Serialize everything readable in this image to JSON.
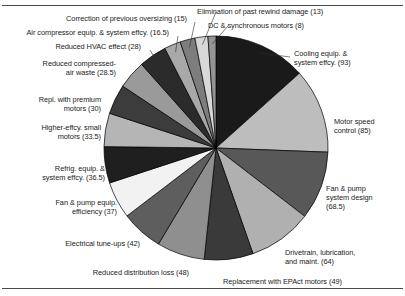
{
  "figure": {
    "kind": "pie-chart-figure",
    "background": "#ffffff",
    "rule_color": "#4a4a4a"
  },
  "chart_data": {
    "type": "pie",
    "title": "",
    "xlabel": "",
    "ylabel": "",
    "legend_position": "callout-labels",
    "grid": false,
    "total": 715.5,
    "units": "billion kWh",
    "start_angle_deg": 0,
    "direction": "clockwise",
    "center": [
      216,
      148
    ],
    "radius": 112,
    "categories": [
      "Cooling equip. & system effcy.",
      "Motor speed control",
      "Fan & pump system design",
      "Drivetrain, lubrication, and maint.",
      "Replacement with EPAct motors",
      "Reduced distribution loss",
      "Electrical tune-ups",
      "Fan & pump equip. efficiency",
      "Refrig. equip. & system effcy.",
      "Higher-effcy. small motors",
      "Repl. with premium motors",
      "Reduced compressed-air waste",
      "Reduced HVAC effect",
      "Air compressor equip. & system effcy.",
      "Correction of previous oversizing",
      "Elimination of past rewind damage",
      "DC & synchronous motors"
    ],
    "values": [
      93,
      85,
      68.5,
      64,
      49,
      48,
      42,
      37,
      36.5,
      33.5,
      30,
      28.5,
      28,
      16.5,
      15,
      13,
      8
    ],
    "colors": [
      "#1a1a1a",
      "#bdbdbd",
      "#585858",
      "#b0b0b0",
      "#3a3a3a",
      "#8f8f8f",
      "#5e5e5e",
      "#f2f2f2",
      "#1f1f1f",
      "#b5b5b5",
      "#3c3c3c",
      "#9a9a9a",
      "#2b2b2b",
      "#a8a8a8",
      "#7d7d7d",
      "#d8d8d8",
      "#949494"
    ],
    "slice_outline": "#000000"
  },
  "labels": [
    {
      "id": "cooling-equip",
      "lines": [
        "Cooling equip. &",
        "system effcy. (93)"
      ]
    },
    {
      "id": "motor-speed-control",
      "lines": [
        "Motor speed",
        "control (85)"
      ]
    },
    {
      "id": "fan-pump-system",
      "lines": [
        "Fan & pump",
        "system design",
        "(68.5)"
      ]
    },
    {
      "id": "drivetrain",
      "lines": [
        "Drivetrain, lubrication,",
        "and maint. (64)"
      ]
    },
    {
      "id": "epact-motors",
      "lines": [
        "Replacement with EPAct motors (49)"
      ]
    },
    {
      "id": "distribution-loss",
      "lines": [
        "Reduced distribution loss (48)"
      ]
    },
    {
      "id": "electrical-tuneups",
      "lines": [
        "Electrical tune-ups (42)"
      ]
    },
    {
      "id": "fan-pump-equip",
      "lines": [
        "Fan & pump equip.",
        "efficiency (37)"
      ]
    },
    {
      "id": "refrig-equip",
      "lines": [
        "Refrig. equip. &",
        "system effcy. (36.5)"
      ]
    },
    {
      "id": "small-motors",
      "lines": [
        "Higher-effcy. small",
        "motors (33.5)"
      ]
    },
    {
      "id": "premium-motors",
      "lines": [
        "Repl. with premium",
        "motors (30)"
      ]
    },
    {
      "id": "compressed-air",
      "lines": [
        "Reduced compressed-",
        "air waste (28.5)"
      ]
    },
    {
      "id": "hvac-effect",
      "lines": [
        "Reduced HVAC effect (28)"
      ]
    },
    {
      "id": "air-compressor",
      "lines": [
        "Air compressor equip. & system effcy. (16.5)"
      ]
    },
    {
      "id": "oversizing",
      "lines": [
        "Correction of previous oversizing (15)"
      ]
    },
    {
      "id": "rewind-damage",
      "lines": [
        "Elimination of past rewind damage (13)"
      ]
    },
    {
      "id": "dc-sync-motors",
      "lines": [
        "DC & synchronous motors (8)"
      ]
    }
  ]
}
